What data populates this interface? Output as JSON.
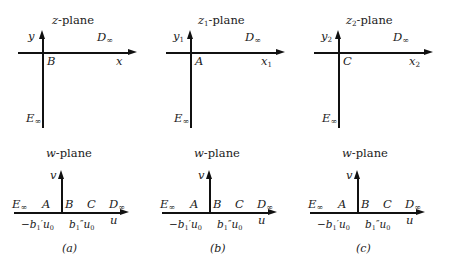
{
  "figure": {
    "panels": [
      {
        "caption": "(a)",
        "top": {
          "title_var": "z",
          "title_sub": "",
          "title_suffix": "-plane",
          "y_axis_var": "y",
          "y_axis_sub": "",
          "x_axis_var": "x",
          "x_axis_sub": "",
          "far_field_label": "D",
          "far_field_sub": "∞",
          "origin_point": "B",
          "bottom_point": "E",
          "bottom_point_sub": "∞"
        },
        "bottom": {
          "title_var": "w",
          "title_suffix": "-plane",
          "v_axis": "v",
          "u_axis": "u",
          "left_infinity": "E",
          "left_infinity_sub": "∞",
          "points": [
            "A",
            "B",
            "C"
          ],
          "right_infinity": "D",
          "right_infinity_sub": "∞",
          "tick_left": "−b",
          "tick_left_sub": "1",
          "tick_left_prime": "′",
          "tick_left_tail": "u",
          "tick_left_tail_sub": "0",
          "tick_right": "b",
          "tick_right_sub": "1",
          "tick_right_prime": "″",
          "tick_right_tail": "u",
          "tick_right_tail_sub": "0"
        }
      },
      {
        "caption": "(b)",
        "top": {
          "title_var": "z",
          "title_sub": "1",
          "title_suffix": "-plane",
          "y_axis_var": "y",
          "y_axis_sub": "1",
          "x_axis_var": "x",
          "x_axis_sub": "1",
          "far_field_label": "D",
          "far_field_sub": "∞",
          "origin_point": "A",
          "bottom_point": "E",
          "bottom_point_sub": "∞"
        },
        "bottom": {
          "title_var": "w",
          "title_suffix": "-plane",
          "v_axis": "v",
          "u_axis": "u",
          "left_infinity": "E",
          "left_infinity_sub": "∞",
          "points": [
            "A",
            "B",
            "C"
          ],
          "right_infinity": "D",
          "right_infinity_sub": "∞",
          "tick_left": "−b",
          "tick_left_sub": "1",
          "tick_left_prime": "′",
          "tick_left_tail": "u",
          "tick_left_tail_sub": "0",
          "tick_right": "b",
          "tick_right_sub": "1",
          "tick_right_prime": "″",
          "tick_right_tail": "u",
          "tick_right_tail_sub": "0"
        }
      },
      {
        "caption": "(c)",
        "top": {
          "title_var": "z",
          "title_sub": "2",
          "title_suffix": "-plane",
          "y_axis_var": "y",
          "y_axis_sub": "2",
          "x_axis_var": "x",
          "x_axis_sub": "2",
          "far_field_label": "D",
          "far_field_sub": "∞",
          "origin_point": "C",
          "bottom_point": "E",
          "bottom_point_sub": "∞"
        },
        "bottom": {
          "title_var": "w",
          "title_suffix": "-plane",
          "v_axis": "v",
          "u_axis": "u",
          "left_infinity": "E",
          "left_infinity_sub": "∞",
          "points": [
            "A",
            "B",
            "C"
          ],
          "right_infinity": "D",
          "right_infinity_sub": "∞",
          "tick_left": "−b",
          "tick_left_sub": "1",
          "tick_left_prime": "′",
          "tick_left_tail": "u",
          "tick_left_tail_sub": "0",
          "tick_right": "b",
          "tick_right_sub": "1",
          "tick_right_prime": "″",
          "tick_right_tail": "u",
          "tick_right_tail_sub": "0"
        }
      }
    ],
    "colors": {
      "ink": "#1b1b1b",
      "line": "#2a2a2a",
      "background": "#ffffff"
    }
  }
}
